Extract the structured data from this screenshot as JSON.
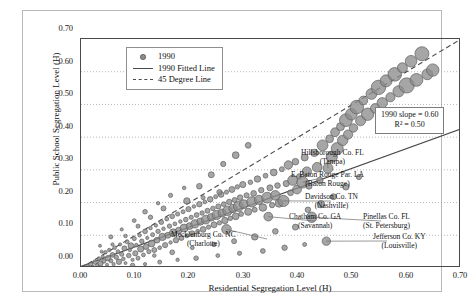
{
  "chart_data": {
    "type": "scatter",
    "title": "",
    "xlabel": "Residential Segregation Level (H)",
    "ylabel": "Public School Segregation Level (H)",
    "xlim": [
      0.0,
      0.7
    ],
    "ylim": [
      0.0,
      0.7
    ],
    "xticks": [
      "0.00",
      "0.10",
      "0.20",
      "0.30",
      "0.40",
      "0.50",
      "0.60",
      "0.70"
    ],
    "yticks": [
      "0.00",
      "0.10",
      "0.20",
      "0.30",
      "0.40",
      "0.50",
      "0.60",
      "0.70"
    ],
    "grid": true,
    "grid_style": "dotted",
    "legend_position": "top-left-inside",
    "legend": [
      {
        "label": "1990",
        "marker": "bubble"
      },
      {
        "label": "1990 Fitted Line",
        "marker": "solid-line"
      },
      {
        "label": "45 Degree Line",
        "marker": "dashed-line"
      }
    ],
    "annotations": {
      "slope_text": "1990 slope = 0.60",
      "r2_text": "R² = 0.50"
    },
    "bubble_color": "#8d8d8d",
    "bubble_edge_color": "#5e5e5e",
    "fit_line_color": "#4a4a4a",
    "identity_line_color": "#4a4a4a",
    "fit_line": {
      "slope": 0.6,
      "intercept": 0.005
    },
    "identity_line": {
      "slope": 1.0,
      "intercept": 0.0
    },
    "callouts": [
      {
        "name": "Hillsborough Co. FL",
        "city": "(Tampa)",
        "x": 0.455,
        "y": 0.305
      },
      {
        "name": "E. Baton Rouge Par. LA",
        "city": "(Baton Rouge)",
        "x": 0.408,
        "y": 0.262
      },
      {
        "name": "Davidson Co. TN",
        "city": "(Nashville)",
        "x": 0.373,
        "y": 0.205
      },
      {
        "name": "Chatham Co. GA",
        "city": "(Savannah)",
        "x": 0.345,
        "y": 0.157
      },
      {
        "name": "Pinellas Co. FL",
        "city": "(St. Petersburg)",
        "x": 0.425,
        "y": 0.155
      },
      {
        "name": "Jefferson Co. KY",
        "city": "(Louisville)",
        "x": 0.452,
        "y": 0.082
      },
      {
        "name": "Mecklenburg Co. NC",
        "city": "(Charlotte)",
        "x": 0.268,
        "y": 0.118
      }
    ],
    "points": [
      {
        "x": 0.012,
        "y": 0.006,
        "r": 1.6
      },
      {
        "x": 0.018,
        "y": 0.012,
        "r": 2.0
      },
      {
        "x": 0.022,
        "y": 0.004,
        "r": 1.5
      },
      {
        "x": 0.026,
        "y": 0.018,
        "r": 2.3
      },
      {
        "x": 0.03,
        "y": 0.009,
        "r": 1.7
      },
      {
        "x": 0.033,
        "y": 0.028,
        "r": 1.9
      },
      {
        "x": 0.036,
        "y": 0.014,
        "r": 2.6
      },
      {
        "x": 0.04,
        "y": 0.035,
        "r": 1.6
      },
      {
        "x": 0.042,
        "y": 0.021,
        "r": 2.1
      },
      {
        "x": 0.045,
        "y": 0.048,
        "r": 1.8
      },
      {
        "x": 0.048,
        "y": 0.01,
        "r": 1.5
      },
      {
        "x": 0.05,
        "y": 0.03,
        "r": 2.8
      },
      {
        "x": 0.052,
        "y": 0.055,
        "r": 1.7
      },
      {
        "x": 0.055,
        "y": 0.022,
        "r": 2.0
      },
      {
        "x": 0.058,
        "y": 0.04,
        "r": 2.4
      },
      {
        "x": 0.06,
        "y": 0.012,
        "r": 1.6
      },
      {
        "x": 0.062,
        "y": 0.062,
        "r": 1.8
      },
      {
        "x": 0.065,
        "y": 0.033,
        "r": 2.2
      },
      {
        "x": 0.068,
        "y": 0.05,
        "r": 1.9
      },
      {
        "x": 0.07,
        "y": 0.019,
        "r": 2.7
      },
      {
        "x": 0.072,
        "y": 0.072,
        "r": 1.6
      },
      {
        "x": 0.075,
        "y": 0.042,
        "r": 2.1
      },
      {
        "x": 0.078,
        "y": 0.028,
        "r": 1.8
      },
      {
        "x": 0.08,
        "y": 0.06,
        "r": 2.5
      },
      {
        "x": 0.082,
        "y": 0.015,
        "r": 1.5
      },
      {
        "x": 0.085,
        "y": 0.08,
        "r": 2.0
      },
      {
        "x": 0.088,
        "y": 0.038,
        "r": 2.3
      },
      {
        "x": 0.09,
        "y": 0.055,
        "r": 1.7
      },
      {
        "x": 0.092,
        "y": 0.068,
        "r": 2.9
      },
      {
        "x": 0.095,
        "y": 0.025,
        "r": 1.6
      },
      {
        "x": 0.098,
        "y": 0.09,
        "r": 2.1
      },
      {
        "x": 0.1,
        "y": 0.045,
        "r": 2.6
      },
      {
        "x": 0.102,
        "y": 0.07,
        "r": 1.8
      },
      {
        "x": 0.105,
        "y": 0.03,
        "r": 2.0
      },
      {
        "x": 0.108,
        "y": 0.1,
        "r": 1.7
      },
      {
        "x": 0.11,
        "y": 0.058,
        "r": 3.1
      },
      {
        "x": 0.112,
        "y": 0.082,
        "r": 2.2
      },
      {
        "x": 0.115,
        "y": 0.04,
        "r": 1.9
      },
      {
        "x": 0.118,
        "y": 0.112,
        "r": 2.4
      },
      {
        "x": 0.12,
        "y": 0.065,
        "r": 2.8
      },
      {
        "x": 0.122,
        "y": 0.092,
        "r": 1.6
      },
      {
        "x": 0.125,
        "y": 0.05,
        "r": 2.1
      },
      {
        "x": 0.128,
        "y": 0.122,
        "r": 1.8
      },
      {
        "x": 0.13,
        "y": 0.075,
        "r": 3.4
      },
      {
        "x": 0.132,
        "y": 0.102,
        "r": 2.0
      },
      {
        "x": 0.135,
        "y": 0.055,
        "r": 2.5
      },
      {
        "x": 0.138,
        "y": 0.13,
        "r": 1.7
      },
      {
        "x": 0.14,
        "y": 0.085,
        "r": 2.9
      },
      {
        "x": 0.142,
        "y": 0.112,
        "r": 2.2
      },
      {
        "x": 0.145,
        "y": 0.062,
        "r": 1.9
      },
      {
        "x": 0.148,
        "y": 0.14,
        "r": 2.3
      },
      {
        "x": 0.15,
        "y": 0.095,
        "r": 3.6
      },
      {
        "x": 0.152,
        "y": 0.12,
        "r": 1.8
      },
      {
        "x": 0.155,
        "y": 0.07,
        "r": 2.6
      },
      {
        "x": 0.158,
        "y": 0.15,
        "r": 2.0
      },
      {
        "x": 0.16,
        "y": 0.1,
        "r": 3.0
      },
      {
        "x": 0.163,
        "y": 0.128,
        "r": 2.2
      },
      {
        "x": 0.165,
        "y": 0.078,
        "r": 1.7
      },
      {
        "x": 0.168,
        "y": 0.158,
        "r": 2.4
      },
      {
        "x": 0.17,
        "y": 0.108,
        "r": 3.8
      },
      {
        "x": 0.173,
        "y": 0.135,
        "r": 1.9
      },
      {
        "x": 0.175,
        "y": 0.085,
        "r": 2.7
      },
      {
        "x": 0.178,
        "y": 0.165,
        "r": 2.1
      },
      {
        "x": 0.18,
        "y": 0.115,
        "r": 3.2
      },
      {
        "x": 0.183,
        "y": 0.142,
        "r": 1.8
      },
      {
        "x": 0.185,
        "y": 0.092,
        "r": 2.5
      },
      {
        "x": 0.188,
        "y": 0.172,
        "r": 2.0
      },
      {
        "x": 0.19,
        "y": 0.122,
        "r": 4.0
      },
      {
        "x": 0.193,
        "y": 0.148,
        "r": 2.3
      },
      {
        "x": 0.195,
        "y": 0.098,
        "r": 1.9
      },
      {
        "x": 0.198,
        "y": 0.18,
        "r": 2.6
      },
      {
        "x": 0.2,
        "y": 0.128,
        "r": 3.4
      },
      {
        "x": 0.203,
        "y": 0.155,
        "r": 2.1
      },
      {
        "x": 0.205,
        "y": 0.105,
        "r": 2.8
      },
      {
        "x": 0.208,
        "y": 0.188,
        "r": 1.8
      },
      {
        "x": 0.21,
        "y": 0.135,
        "r": 4.2
      },
      {
        "x": 0.213,
        "y": 0.162,
        "r": 2.4
      },
      {
        "x": 0.215,
        "y": 0.112,
        "r": 2.0
      },
      {
        "x": 0.218,
        "y": 0.195,
        "r": 2.7
      },
      {
        "x": 0.22,
        "y": 0.142,
        "r": 3.6
      },
      {
        "x": 0.223,
        "y": 0.168,
        "r": 2.2
      },
      {
        "x": 0.225,
        "y": 0.118,
        "r": 2.9
      },
      {
        "x": 0.228,
        "y": 0.202,
        "r": 1.9
      },
      {
        "x": 0.23,
        "y": 0.148,
        "r": 4.4
      },
      {
        "x": 0.233,
        "y": 0.175,
        "r": 2.5
      },
      {
        "x": 0.235,
        "y": 0.125,
        "r": 2.1
      },
      {
        "x": 0.238,
        "y": 0.21,
        "r": 2.8
      },
      {
        "x": 0.24,
        "y": 0.155,
        "r": 3.8
      },
      {
        "x": 0.243,
        "y": 0.182,
        "r": 2.3
      },
      {
        "x": 0.245,
        "y": 0.132,
        "r": 3.0
      },
      {
        "x": 0.248,
        "y": 0.218,
        "r": 2.0
      },
      {
        "x": 0.25,
        "y": 0.162,
        "r": 4.6
      },
      {
        "x": 0.253,
        "y": 0.188,
        "r": 2.6
      },
      {
        "x": 0.255,
        "y": 0.138,
        "r": 2.2
      },
      {
        "x": 0.258,
        "y": 0.225,
        "r": 2.9
      },
      {
        "x": 0.26,
        "y": 0.168,
        "r": 4.0
      },
      {
        "x": 0.263,
        "y": 0.195,
        "r": 2.4
      },
      {
        "x": 0.265,
        "y": 0.145,
        "r": 3.2
      },
      {
        "x": 0.268,
        "y": 0.232,
        "r": 2.1
      },
      {
        "x": 0.27,
        "y": 0.175,
        "r": 4.8
      },
      {
        "x": 0.273,
        "y": 0.202,
        "r": 2.7
      },
      {
        "x": 0.275,
        "y": 0.152,
        "r": 2.3
      },
      {
        "x": 0.278,
        "y": 0.24,
        "r": 3.0
      },
      {
        "x": 0.28,
        "y": 0.182,
        "r": 4.2
      },
      {
        "x": 0.283,
        "y": 0.208,
        "r": 2.5
      },
      {
        "x": 0.285,
        "y": 0.158,
        "r": 3.4
      },
      {
        "x": 0.288,
        "y": 0.248,
        "r": 2.2
      },
      {
        "x": 0.29,
        "y": 0.188,
        "r": 5.0
      },
      {
        "x": 0.293,
        "y": 0.215,
        "r": 2.8
      },
      {
        "x": 0.295,
        "y": 0.165,
        "r": 2.4
      },
      {
        "x": 0.298,
        "y": 0.255,
        "r": 3.1
      },
      {
        "x": 0.3,
        "y": 0.195,
        "r": 4.4
      },
      {
        "x": 0.305,
        "y": 0.222,
        "r": 2.6
      },
      {
        "x": 0.308,
        "y": 0.172,
        "r": 3.6
      },
      {
        "x": 0.312,
        "y": 0.262,
        "r": 2.3
      },
      {
        "x": 0.315,
        "y": 0.202,
        "r": 5.2
      },
      {
        "x": 0.318,
        "y": 0.228,
        "r": 2.9
      },
      {
        "x": 0.32,
        "y": 0.178,
        "r": 2.5
      },
      {
        "x": 0.325,
        "y": 0.272,
        "r": 3.2
      },
      {
        "x": 0.328,
        "y": 0.208,
        "r": 4.6
      },
      {
        "x": 0.332,
        "y": 0.238,
        "r": 2.7
      },
      {
        "x": 0.335,
        "y": 0.185,
        "r": 3.8
      },
      {
        "x": 0.34,
        "y": 0.282,
        "r": 2.4
      },
      {
        "x": 0.343,
        "y": 0.215,
        "r": 5.4
      },
      {
        "x": 0.348,
        "y": 0.245,
        "r": 3.0
      },
      {
        "x": 0.352,
        "y": 0.192,
        "r": 2.6
      },
      {
        "x": 0.355,
        "y": 0.292,
        "r": 3.4
      },
      {
        "x": 0.358,
        "y": 0.222,
        "r": 4.8
      },
      {
        "x": 0.362,
        "y": 0.252,
        "r": 2.8
      },
      {
        "x": 0.365,
        "y": 0.198,
        "r": 4.0
      },
      {
        "x": 0.37,
        "y": 0.302,
        "r": 2.5
      },
      {
        "x": 0.373,
        "y": 0.205,
        "r": 5.6
      },
      {
        "x": 0.378,
        "y": 0.258,
        "r": 3.1
      },
      {
        "x": 0.382,
        "y": 0.315,
        "r": 4.2
      },
      {
        "x": 0.386,
        "y": 0.23,
        "r": 2.9
      },
      {
        "x": 0.39,
        "y": 0.268,
        "r": 5.0
      },
      {
        "x": 0.395,
        "y": 0.325,
        "r": 3.3
      },
      {
        "x": 0.398,
        "y": 0.24,
        "r": 4.4
      },
      {
        "x": 0.402,
        "y": 0.28,
        "r": 2.7
      },
      {
        "x": 0.408,
        "y": 0.262,
        "r": 5.8
      },
      {
        "x": 0.412,
        "y": 0.338,
        "r": 3.5
      },
      {
        "x": 0.416,
        "y": 0.295,
        "r": 4.6
      },
      {
        "x": 0.42,
        "y": 0.25,
        "r": 3.0
      },
      {
        "x": 0.425,
        "y": 0.155,
        "r": 5.2
      },
      {
        "x": 0.43,
        "y": 0.352,
        "r": 3.7
      },
      {
        "x": 0.435,
        "y": 0.308,
        "r": 4.8
      },
      {
        "x": 0.44,
        "y": 0.268,
        "r": 3.2
      },
      {
        "x": 0.445,
        "y": 0.375,
        "r": 5.4
      },
      {
        "x": 0.452,
        "y": 0.082,
        "r": 4.2
      },
      {
        "x": 0.455,
        "y": 0.305,
        "r": 5.0
      },
      {
        "x": 0.458,
        "y": 0.395,
        "r": 3.9
      },
      {
        "x": 0.462,
        "y": 0.34,
        "r": 5.6
      },
      {
        "x": 0.468,
        "y": 0.415,
        "r": 4.4
      },
      {
        "x": 0.472,
        "y": 0.365,
        "r": 6.0
      },
      {
        "x": 0.478,
        "y": 0.432,
        "r": 4.0
      },
      {
        "x": 0.482,
        "y": 0.39,
        "r": 5.2
      },
      {
        "x": 0.488,
        "y": 0.452,
        "r": 6.4
      },
      {
        "x": 0.492,
        "y": 0.408,
        "r": 4.6
      },
      {
        "x": 0.498,
        "y": 0.47,
        "r": 5.8
      },
      {
        "x": 0.502,
        "y": 0.428,
        "r": 4.2
      },
      {
        "x": 0.508,
        "y": 0.492,
        "r": 6.8
      },
      {
        "x": 0.515,
        "y": 0.45,
        "r": 5.0
      },
      {
        "x": 0.52,
        "y": 0.512,
        "r": 4.4
      },
      {
        "x": 0.528,
        "y": 0.47,
        "r": 6.2
      },
      {
        "x": 0.535,
        "y": 0.532,
        "r": 5.4
      },
      {
        "x": 0.542,
        "y": 0.488,
        "r": 4.8
      },
      {
        "x": 0.548,
        "y": 0.552,
        "r": 7.2
      },
      {
        "x": 0.555,
        "y": 0.505,
        "r": 5.2
      },
      {
        "x": 0.562,
        "y": 0.572,
        "r": 6.0
      },
      {
        "x": 0.57,
        "y": 0.522,
        "r": 4.6
      },
      {
        "x": 0.578,
        "y": 0.592,
        "r": 6.8
      },
      {
        "x": 0.585,
        "y": 0.54,
        "r": 5.6
      },
      {
        "x": 0.592,
        "y": 0.612,
        "r": 5.0
      },
      {
        "x": 0.6,
        "y": 0.558,
        "r": 7.6
      },
      {
        "x": 0.608,
        "y": 0.632,
        "r": 5.8
      },
      {
        "x": 0.618,
        "y": 0.575,
        "r": 6.4
      },
      {
        "x": 0.628,
        "y": 0.655,
        "r": 7.0
      },
      {
        "x": 0.638,
        "y": 0.592,
        "r": 5.4
      },
      {
        "x": 0.648,
        "y": 0.605,
        "r": 6.2
      },
      {
        "x": 0.268,
        "y": 0.118,
        "r": 4.8
      },
      {
        "x": 0.345,
        "y": 0.157,
        "r": 4.4
      },
      {
        "x": 0.195,
        "y": 0.205,
        "r": 3.2
      },
      {
        "x": 0.218,
        "y": 0.25,
        "r": 2.8
      },
      {
        "x": 0.24,
        "y": 0.285,
        "r": 3.0
      },
      {
        "x": 0.262,
        "y": 0.318,
        "r": 2.6
      },
      {
        "x": 0.285,
        "y": 0.345,
        "r": 3.4
      },
      {
        "x": 0.308,
        "y": 0.375,
        "r": 2.9
      },
      {
        "x": 0.152,
        "y": 0.182,
        "r": 2.5
      },
      {
        "x": 0.128,
        "y": 0.155,
        "r": 2.2
      },
      {
        "x": 0.105,
        "y": 0.128,
        "r": 2.0
      },
      {
        "x": 0.082,
        "y": 0.098,
        "r": 1.8
      },
      {
        "x": 0.058,
        "y": 0.072,
        "r": 1.6
      },
      {
        "x": 0.038,
        "y": 0.05,
        "r": 1.5
      },
      {
        "x": 0.335,
        "y": 0.052,
        "r": 2.4
      },
      {
        "x": 0.292,
        "y": 0.045,
        "r": 2.1
      },
      {
        "x": 0.252,
        "y": 0.038,
        "r": 1.9
      },
      {
        "x": 0.212,
        "y": 0.03,
        "r": 2.3
      },
      {
        "x": 0.178,
        "y": 0.025,
        "r": 1.7
      },
      {
        "x": 0.145,
        "y": 0.018,
        "r": 2.0
      },
      {
        "x": 0.118,
        "y": 0.012,
        "r": 1.6
      },
      {
        "x": 0.095,
        "y": 0.008,
        "r": 2.2
      },
      {
        "x": 0.375,
        "y": 0.062,
        "r": 2.7
      },
      {
        "x": 0.412,
        "y": 0.072,
        "r": 2.0
      },
      {
        "x": 0.32,
        "y": 0.095,
        "r": 3.2
      },
      {
        "x": 0.358,
        "y": 0.112,
        "r": 2.8
      },
      {
        "x": 0.395,
        "y": 0.125,
        "r": 3.0
      },
      {
        "x": 0.282,
        "y": 0.082,
        "r": 2.5
      },
      {
        "x": 0.245,
        "y": 0.072,
        "r": 2.2
      },
      {
        "x": 0.205,
        "y": 0.062,
        "r": 1.9
      },
      {
        "x": 0.168,
        "y": 0.048,
        "r": 2.4
      },
      {
        "x": 0.135,
        "y": 0.038,
        "r": 1.8
      },
      {
        "x": 0.225,
        "y": 0.215,
        "r": 2.0
      },
      {
        "x": 0.255,
        "y": 0.232,
        "r": 2.6
      },
      {
        "x": 0.19,
        "y": 0.245,
        "r": 1.8
      },
      {
        "x": 0.165,
        "y": 0.222,
        "r": 2.1
      },
      {
        "x": 0.142,
        "y": 0.198,
        "r": 1.7
      },
      {
        "x": 0.118,
        "y": 0.172,
        "r": 2.3
      },
      {
        "x": 0.098,
        "y": 0.145,
        "r": 1.9
      },
      {
        "x": 0.075,
        "y": 0.118,
        "r": 1.6
      },
      {
        "x": 0.055,
        "y": 0.095,
        "r": 2.0
      },
      {
        "x": 0.035,
        "y": 0.068,
        "r": 1.5
      },
      {
        "x": 0.442,
        "y": 0.195,
        "r": 3.6
      },
      {
        "x": 0.465,
        "y": 0.218,
        "r": 3.0
      },
      {
        "x": 0.418,
        "y": 0.178,
        "r": 2.8
      },
      {
        "x": 0.488,
        "y": 0.248,
        "r": 3.2
      },
      {
        "x": 0.512,
        "y": 0.278,
        "r": 2.6
      }
    ]
  }
}
